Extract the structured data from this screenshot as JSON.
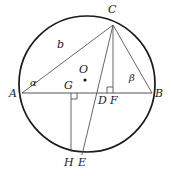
{
  "figure": {
    "type": "geometry-diagram",
    "width": 171,
    "height": 176,
    "background_color": "#ffffff",
    "stroke_color": "#3a3a3a",
    "circle_stroke_color": "#1a1a1a",
    "label_color": "#1a1a1a"
  },
  "circle": {
    "name": "circumcircle",
    "cx": 87,
    "cy": 84,
    "r": 68,
    "stroke_width": 1.6
  },
  "points": [
    {
      "id": "A",
      "label": "A",
      "x": 22,
      "y": 93,
      "label_x": 11,
      "label_y": 95,
      "dot": false
    },
    {
      "id": "B",
      "label": "B",
      "x": 152,
      "y": 93,
      "label_x": 156,
      "label_y": 95,
      "dot": false
    },
    {
      "id": "C",
      "label": "C",
      "x": 113,
      "y": 25,
      "label_x": 110,
      "label_y": 6,
      "dot": false
    },
    {
      "id": "O",
      "label": "O",
      "x": 85,
      "y": 80,
      "label_x": 80,
      "label_y": 66,
      "dot": true
    },
    {
      "id": "G",
      "label": "G",
      "x": 71,
      "y": 93,
      "label_x": 65,
      "label_y": 84,
      "dot": false
    },
    {
      "id": "D",
      "label": "D",
      "x": 104,
      "y": 93,
      "label_x": 99,
      "label_y": 97,
      "dot": false
    },
    {
      "id": "F",
      "label": "F",
      "x": 113,
      "y": 93,
      "label_x": 111,
      "label_y": 97,
      "dot": false
    },
    {
      "id": "H",
      "label": "H",
      "x": 71,
      "y": 152,
      "label_x": 65,
      "label_y": 159,
      "dot": false
    },
    {
      "id": "E",
      "label": "E",
      "x": 82,
      "y": 155,
      "label_x": 79,
      "label_y": 159,
      "dot": false
    }
  ],
  "segments": [
    {
      "id": "AB",
      "from": "A",
      "to": "B",
      "name": "chord-ab"
    },
    {
      "id": "AC",
      "from": "A",
      "to": "C",
      "name": "chord-ac"
    },
    {
      "id": "CB",
      "from": "C",
      "to": "B",
      "name": "chord-cb"
    },
    {
      "id": "CF",
      "from": "C",
      "to": "F",
      "name": "altitude-cf"
    },
    {
      "id": "CE",
      "from": "C",
      "to": "E",
      "name": "cevian-ce"
    },
    {
      "id": "GH",
      "from": "G",
      "to": "H",
      "name": "perpendicular-gh"
    }
  ],
  "labels": {
    "side_b": {
      "text": "b",
      "x": 59,
      "y": 44,
      "name": "side-label-b"
    },
    "angle_alpha": {
      "text": "α",
      "x": 31,
      "y": 82,
      "name": "angle-label-alpha"
    },
    "angle_beta": {
      "text": "β",
      "x": 130,
      "y": 77,
      "name": "angle-label-beta"
    }
  },
  "right_angle_marks": [
    {
      "id": "mark-at-F",
      "x": 113,
      "y": 93,
      "name": "right-angle-mark-f",
      "orient": "up-left"
    },
    {
      "id": "mark-at-G",
      "x": 71,
      "y": 93,
      "name": "right-angle-mark-g",
      "orient": "down-right"
    }
  ]
}
